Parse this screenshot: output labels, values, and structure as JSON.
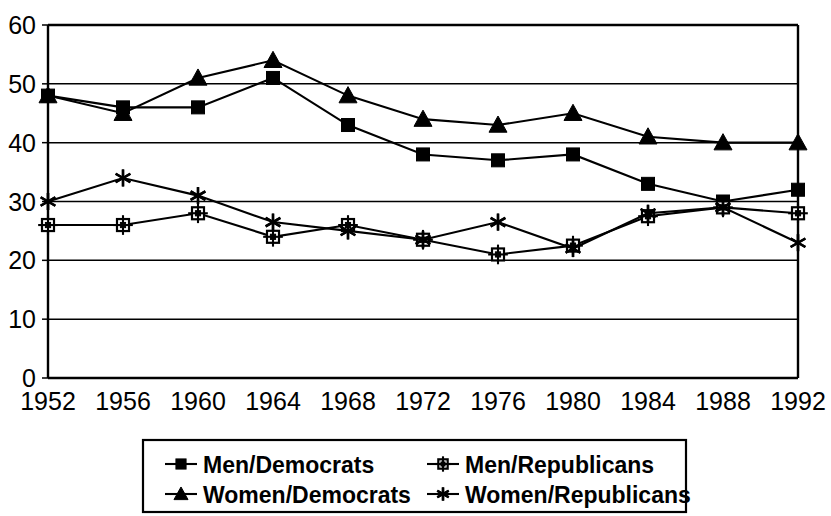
{
  "chart_data": {
    "type": "line",
    "title": "",
    "subtitle": "",
    "xlabel": "",
    "ylabel": "",
    "grid": true,
    "legend_position": "bottom",
    "categories": [
      "1952",
      "1956",
      "1960",
      "1964",
      "1968",
      "1972",
      "1976",
      "1980",
      "1984",
      "1988",
      "1992"
    ],
    "x": [
      1952,
      1956,
      1960,
      1964,
      1968,
      1972,
      1976,
      1980,
      1984,
      1988,
      1992
    ],
    "ylim": [
      0,
      60
    ],
    "yticks": [
      0,
      10,
      20,
      30,
      40,
      50,
      60
    ],
    "ytick_labels": [
      "0",
      "10",
      "20",
      "30",
      "40",
      "50",
      "60"
    ],
    "series": [
      {
        "name": "Men/Democrats",
        "marker": "filled-square",
        "values": [
          48,
          46,
          46,
          51,
          43,
          38,
          37,
          38,
          33,
          30,
          32
        ]
      },
      {
        "name": "Men/Republicans",
        "marker": "open-square-dot",
        "values": [
          26,
          26,
          28,
          24,
          26,
          23.5,
          21,
          22.5,
          27.5,
          29,
          28
        ]
      },
      {
        "name": "Women/Democrats",
        "marker": "filled-triangle",
        "values": [
          48,
          45,
          51,
          54,
          48,
          44,
          43,
          45,
          41,
          40,
          40
        ]
      },
      {
        "name": "Women/Republicans",
        "marker": "star",
        "values": [
          30,
          34,
          31,
          26.5,
          25,
          23.5,
          26.5,
          22,
          28,
          29,
          23
        ]
      }
    ]
  },
  "legend": {
    "entries": [
      {
        "label": "Men/Democrats",
        "marker": "filled-square"
      },
      {
        "label": "Men/Republicans",
        "marker": "open-square-dot"
      },
      {
        "label": "Women/Democrats",
        "marker": "filled-triangle"
      },
      {
        "label": "Women/Republicans",
        "marker": "star"
      }
    ]
  }
}
